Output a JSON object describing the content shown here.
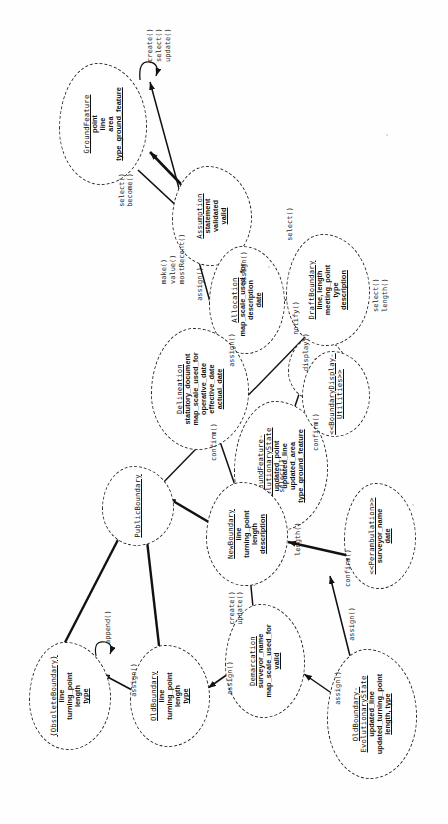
{
  "diagram": {
    "notation": "UML analysis objects drawn as clouds with dashed outlines",
    "stroke_color": "#1a1a1a",
    "background": "#ffffff"
  },
  "objects": [
    {
      "id": "ground_feature",
      "name": "GroundFeature",
      "attributes": [
        "point",
        "line",
        "area",
        "type_ground_feature"
      ],
      "operations": [
        "create()",
        "select()",
        "update()"
      ],
      "x": 700,
      "y": 103,
      "w": 120,
      "h": 86,
      "ops_x": 762,
      "ops_y": 152,
      "ops_align": "left"
    },
    {
      "id": "assumption",
      "name": "Assumption",
      "attributes": [
        "statement",
        "validated",
        "valid"
      ],
      "operations": [
        "make()",
        "value()",
        "mostRecent()"
      ],
      "x": 608,
      "y": 212,
      "w": 98,
      "h": 78,
      "ops_x": 556,
      "ops_y": 168,
      "ops_align": "left"
    },
    {
      "id": "allocation",
      "name": "Allocation",
      "attributes": [
        "map_scale_used_for",
        "description",
        "date"
      ],
      "operations": [],
      "x": 524,
      "y": 247,
      "w": 106,
      "h": 74,
      "ops_x": 0,
      "ops_y": 0,
      "ops_align": "left"
    },
    {
      "id": "motif",
      "name": "Motif",
      "attributes": [],
      "operations": [],
      "x": 455,
      "y": 318,
      "w": 62,
      "h": 58,
      "ops_x": 0,
      "ops_y": 0,
      "ops_align": "left"
    },
    {
      "id": "ground_feature_evolutionary_state",
      "name": "GroundFeature-\nEvolutionaryState",
      "attributes": [
        "updated_point",
        "updated_line",
        "updated_area",
        "type_ground_feature"
      ],
      "operations": [],
      "x": 358,
      "y": 281,
      "w": 128,
      "h": 92,
      "ops_x": 0,
      "ops_y": 0,
      "ops_align": "left"
    },
    {
      "id": "draft_boundary",
      "name": "DraftBoundary",
      "attributes": [
        "line, length",
        "meeting_point",
        "type",
        "description"
      ],
      "operations": [
        "select()",
        "length()"
      ],
      "x": 534,
      "y": 328,
      "w": 110,
      "h": 82,
      "ops_x": 504,
      "ops_y": 372,
      "ops_align": "left"
    },
    {
      "id": "boundary_display_utilities",
      "name": "<<BoundaryDisplay-\nUtilities>>",
      "attributes": [],
      "operations": [],
      "x": 430,
      "y": 330,
      "w": 84,
      "h": 66,
      "ops_x": 0,
      "ops_y": 0,
      "ops_align": "left"
    },
    {
      "id": "delineation",
      "name": "Delineation",
      "attributes": [
        "statutory_document",
        "map_scale_used_for",
        "operative_date",
        "effective_date",
        "actual_date"
      ],
      "operations": [],
      "x": 435,
      "y": 200,
      "w": 120,
      "h": 96,
      "ops_x": 0,
      "ops_y": 0,
      "ops_align": "left"
    },
    {
      "id": "public_boundary",
      "name": "PublicBoundary",
      "attributes": [],
      "operations": [],
      "x": 318,
      "y": 138,
      "w": 78,
      "h": 70,
      "ops_x": 0,
      "ops_y": 0,
      "ops_align": "left"
    },
    {
      "id": "new_boundary",
      "name": "NewBoundary",
      "attributes": [
        "line",
        "turning_point",
        "length",
        "description"
      ],
      "operations": [
        "length()"
      ],
      "x": 290,
      "y": 247,
      "w": 102,
      "h": 80,
      "ops_x": 262,
      "ops_y": 296,
      "ops_align": "left"
    },
    {
      "id": "perambulation",
      "name": "<<Perambulation>>",
      "attributes": [
        "surveyor_name",
        "date"
      ],
      "operations": [],
      "x": 288,
      "y": 380,
      "w": 104,
      "h": 70,
      "ops_x": 0,
      "ops_y": 0,
      "ops_align": "left"
    },
    {
      "id": "demarcation",
      "name": "Demarcation",
      "attributes": [
        "surveyor_name",
        "map_scale_used_for",
        "valid"
      ],
      "operations": [],
      "x": 163,
      "y": 265,
      "w": 112,
      "h": 78,
      "ops_x": 0,
      "ops_y": 0,
      "ops_align": "left"
    },
    {
      "id": "obsolete_boundary",
      "name": "{ObsoleteBoundary}",
      "attributes": [
        "line",
        "turning_point",
        "length",
        "type"
      ],
      "operations": [
        "append()"
      ],
      "x": 128,
      "y": 70,
      "w": 106,
      "h": 80,
      "ops_x": 172,
      "ops_y": 108,
      "ops_align": "left"
    },
    {
      "id": "old_boundary",
      "name": "OldBoundary",
      "attributes": [
        "line",
        "turning_point",
        "length",
        "type"
      ],
      "operations": [],
      "x": 128,
      "y": 168,
      "w": 100,
      "h": 78,
      "ops_x": 0,
      "ops_y": 0,
      "ops_align": "left"
    },
    {
      "id": "old_boundary_evolutionary_state",
      "name": "OldBoundary-\nEvolutionaryState",
      "attributes": [
        "updated_line",
        "updated_turning_point",
        "length, type"
      ],
      "operations": [],
      "x": 110,
      "y": 370,
      "w": 128,
      "h": 88,
      "ops_x": 0,
      "ops_y": 0,
      "ops_align": "left"
    }
  ],
  "messages": [
    {
      "id": "m_select_become",
      "label": "select()\nbecome()",
      "x": 634,
      "y": 126
    },
    {
      "id": "m_select_gf_alloc",
      "label": "select()",
      "x": 586,
      "y": 292
    },
    {
      "id": "m_assign_gfes",
      "label": "assign()",
      "x": 526,
      "y": 150
    },
    {
      "id": "m_assign_assump",
      "label": "assign()",
      "x": 568,
      "y": 248
    },
    {
      "id": "m_assign_alloc_delin",
      "label": "assign()",
      "x": 470,
      "y": 196
    },
    {
      "id": "m_notify",
      "label": "notify()",
      "x": 472,
      "y": 394
    },
    {
      "id": "m_display",
      "label": "display()",
      "x": 470,
      "y": 300
    },
    {
      "id": "m_confirm_delin",
      "label": "confirm()",
      "x": 392,
      "y": 200
    },
    {
      "id": "m_confirm_motif",
      "label": "confirm()",
      "x": 333,
      "y": 330
    },
    {
      "id": "m_confirm_peramb",
      "label": "confirm()",
      "x": 208,
      "y": 356
    },
    {
      "id": "m_select_nb",
      "label": "select()",
      "x": 250,
      "y": 285
    },
    {
      "id": "m_create_update",
      "label": "create()\nupdate()",
      "x": 190,
      "y": 232
    },
    {
      "id": "m_assign_demarc",
      "label": "assign()",
      "x": 150,
      "y": 198
    },
    {
      "id": "m_assign_old",
      "label": "assign()",
      "x": 152,
      "y": 120
    },
    {
      "id": "m_assign_obes",
      "label": "assign()",
      "x": 190,
      "y": 372
    },
    {
      "id": "m_assign_lower",
      "label": "assign()",
      "x": 100,
      "y": 300
    }
  ]
}
